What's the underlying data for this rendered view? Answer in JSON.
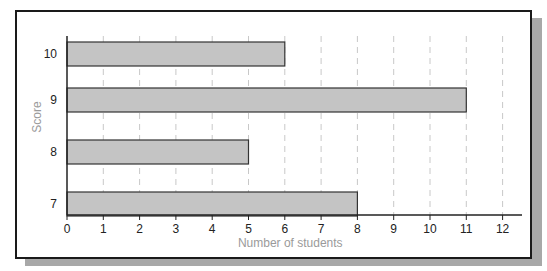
{
  "chart_data": {
    "type": "bar",
    "orientation": "horizontal",
    "title": "",
    "categories": [
      "10",
      "9",
      "8",
      "7"
    ],
    "values": [
      6,
      11,
      5,
      8
    ],
    "xlabel": "Number of students",
    "ylabel": "Score",
    "xlim": [
      0,
      12
    ],
    "xticks": [
      "0",
      "1",
      "2",
      "3",
      "4",
      "5",
      "6",
      "7",
      "8",
      "9",
      "10",
      "11",
      "12"
    ],
    "grid": "vertical dashed",
    "legend": null,
    "bar_color": "#c4c4c4",
    "bar_edge_color": "#333333"
  }
}
